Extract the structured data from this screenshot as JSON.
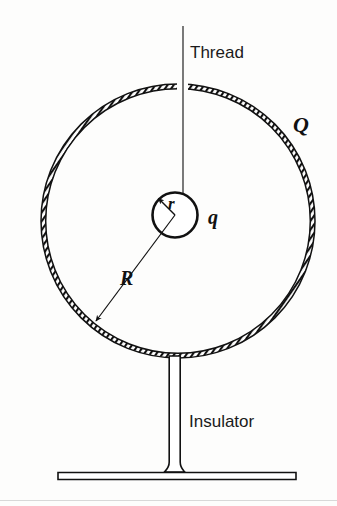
{
  "figure": {
    "background_color": "#fdfdfc",
    "ink_color": "#111111",
    "labels": {
      "thread": "Thread",
      "insulator": "Insulator",
      "shell_charge": "Q",
      "inner_charge": "q",
      "inner_radius": "r",
      "outer_radius": "R"
    },
    "geometry": {
      "outer_shell": {
        "cx": 178,
        "cy": 221,
        "r": 137,
        "thickness": 5,
        "gap_top_degrees": 6
      },
      "inner_sphere": {
        "cx": 175,
        "cy": 215,
        "r": 23
      },
      "thread": {
        "x": 183,
        "y_top": 26,
        "y_bottom": 193
      },
      "radius_arrow_r": {
        "x1": 175,
        "y1": 215,
        "x2": 159,
        "y2": 199
      },
      "radius_arrow_R": {
        "x1": 175,
        "y1": 215,
        "x2": 96,
        "y2": 321
      },
      "insulator_column": {
        "x_left": 168,
        "x_right": 181,
        "y_top": 357,
        "y_bottom": 472
      },
      "insulator_base": {
        "x_left": 58,
        "x_right": 296,
        "y_top": 472,
        "y_bottom": 480
      },
      "page_rule": {
        "y": 500,
        "x_left": 0,
        "x_right": 337
      }
    }
  }
}
